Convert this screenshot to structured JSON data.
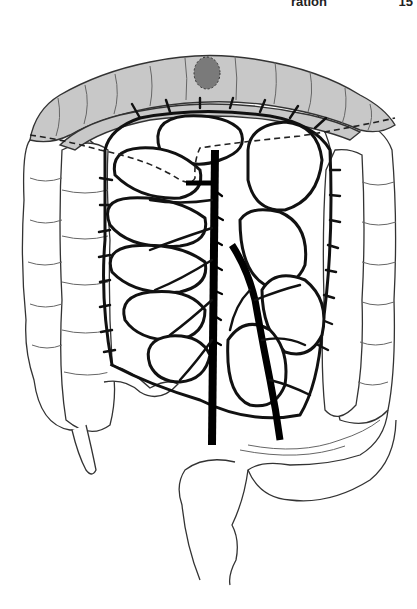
{
  "header": {
    "running_title": "ration",
    "page_number": "15"
  },
  "figure": {
    "colors": {
      "transverse_colon_shade": "#c8c8c8",
      "lesion": "#7a7a7a",
      "outline": "#111111",
      "background": "#ffffff"
    },
    "parts": [
      "transverse-colon (shaded)",
      "tumor-lesion",
      "ascending-colon",
      "descending-colon",
      "sigmoid-colon",
      "rectum",
      "appendix",
      "terminal-ileum",
      "small-bowel-loops",
      "superior-mesenteric-artery",
      "inferior-mesenteric-artery",
      "marginal-vessel-arcades",
      "resection-line (dashed)"
    ]
  }
}
